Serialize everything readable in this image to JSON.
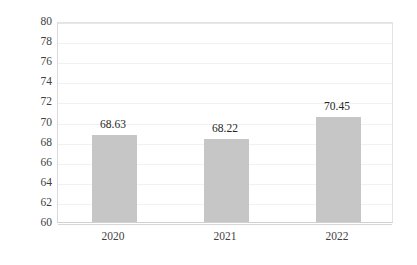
{
  "chart_data": {
    "type": "bar",
    "title": "",
    "subtitle": "",
    "xlabel": "",
    "ylabel": "",
    "categories": [
      "2020",
      "2021",
      "2022"
    ],
    "values": [
      68.63,
      68.22,
      70.45
    ],
    "data_labels": [
      "68.63",
      "68.22",
      "70.45"
    ],
    "ylim": [
      60,
      80
    ],
    "y_ticks": [
      80,
      78,
      76,
      74,
      72,
      70,
      68,
      66,
      64,
      62,
      60
    ],
    "y_tick_labels": [
      "80",
      "78",
      "76",
      "74",
      "72",
      "70",
      "68",
      "66",
      "64",
      "62",
      "60"
    ],
    "grid": true,
    "grid_axis": "y",
    "legend": false,
    "legend_position": "none",
    "series": [
      {
        "name": "",
        "values": [
          68.63,
          68.22,
          70.45
        ]
      }
    ]
  },
  "style": {
    "bar_color": "#c6c6c6",
    "grid_color": "#f1f1f1",
    "axis_color": "#d9d9d9",
    "text_color": "#3f3f3f",
    "label_color": "#262626",
    "background": "#ffffff"
  }
}
